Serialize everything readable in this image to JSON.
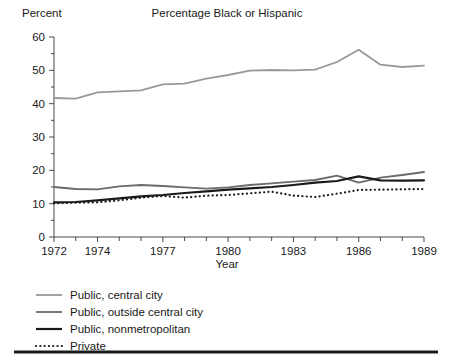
{
  "chart_data": {
    "type": "line",
    "title": "Percentage Black or Hispanic",
    "xlabel": "Year",
    "ylabel": "Percent",
    "x": [
      1972,
      1973,
      1974,
      1975,
      1976,
      1977,
      1978,
      1979,
      1980,
      1981,
      1982,
      1983,
      1984,
      1985,
      1986,
      1987,
      1988,
      1989
    ],
    "xlim": [
      1972,
      1989
    ],
    "ylim": [
      0,
      60
    ],
    "ytick_labels": [
      "0",
      "10",
      "20",
      "30",
      "40",
      "50",
      "60"
    ],
    "ytick_values": [
      0,
      10,
      20,
      30,
      40,
      50,
      60
    ],
    "ytick_minor_step": 5,
    "xtick_labels": [
      "1972",
      "1974",
      "1977",
      "1980",
      "1983",
      "1986",
      "1989"
    ],
    "xtick_label_values": [
      1972,
      1974,
      1977,
      1980,
      1983,
      1986,
      1989
    ],
    "xtick_minor_step": 1,
    "grid": false,
    "legend_position": "below-left",
    "series": [
      {
        "name": "Public, central city",
        "color": "#999999",
        "width": 1.8,
        "dash": "none",
        "values": [
          41.7,
          41.5,
          43.4,
          43.7,
          44.0,
          45.8,
          46.0,
          47.5,
          48.6,
          49.9,
          50.1,
          50.0,
          50.2,
          52.5,
          56.2,
          51.7,
          51.0,
          51.4
        ]
      },
      {
        "name": "Public, outside central city",
        "color": "#6b6b6b",
        "width": 1.8,
        "dash": "none",
        "values": [
          15.0,
          14.4,
          14.3,
          15.2,
          15.6,
          15.3,
          14.9,
          14.5,
          14.9,
          15.6,
          16.1,
          16.6,
          17.1,
          18.4,
          16.3,
          17.8,
          18.6,
          19.5
        ]
      },
      {
        "name": "Public, nonmetropolitan",
        "color": "#1a1a1a",
        "width": 2.2,
        "dash": "none",
        "values": [
          10.4,
          10.5,
          11.0,
          11.6,
          12.2,
          12.6,
          13.2,
          13.7,
          14.2,
          14.6,
          15.0,
          15.6,
          16.3,
          16.8,
          18.2,
          17.0,
          16.9,
          17.0
        ]
      },
      {
        "name": "Private",
        "color": "#1a1a1a",
        "width": 2.2,
        "dash": "dotted",
        "values": [
          10.1,
          10.3,
          10.4,
          11.0,
          11.8,
          12.3,
          11.8,
          12.4,
          12.6,
          13.1,
          13.6,
          12.4,
          12.0,
          13.0,
          14.1,
          14.2,
          14.3,
          14.4
        ]
      }
    ]
  },
  "legend": {
    "items": [
      {
        "label": "Public, central city"
      },
      {
        "label": "Public, outside central city"
      },
      {
        "label": "Public, nonmetropolitan"
      },
      {
        "label": "Private"
      }
    ]
  }
}
